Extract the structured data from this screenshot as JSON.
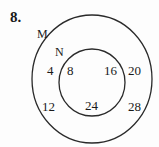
{
  "question": {
    "number_label": "8."
  },
  "diagram": {
    "type": "venn",
    "stroke_color": "#2a2a2a",
    "sets": [
      {
        "name": "M",
        "label": "M",
        "role": "outer",
        "elements": [
          "4",
          "8",
          "12",
          "16",
          "20",
          "24",
          "28"
        ]
      },
      {
        "name": "N",
        "label": "N",
        "role": "inner-subset-of-M",
        "elements": [
          "8",
          "16",
          "24"
        ]
      }
    ],
    "regions": {
      "M_only": [
        "4",
        "20",
        "12",
        "28"
      ],
      "N": [
        "8",
        "16",
        "24"
      ]
    },
    "labels": {
      "m": "M",
      "n": "N",
      "v4": "4",
      "v8": "8",
      "v16": "16",
      "v20": "20",
      "v12": "12",
      "v24": "24",
      "v28": "28"
    }
  }
}
